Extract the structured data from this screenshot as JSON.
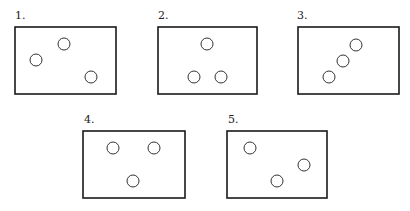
{
  "panels": [
    {
      "label": "1.",
      "rect": {
        "x": 15,
        "y": 27,
        "w": 101,
        "h": 67
      },
      "label_pos": {
        "x": 15,
        "y": 19
      },
      "circles": [
        {
          "cx": 36,
          "cy": 60
        },
        {
          "cx": 64,
          "cy": 44
        },
        {
          "cx": 91,
          "cy": 77
        }
      ]
    },
    {
      "label": "2.",
      "rect": {
        "x": 158,
        "y": 27,
        "w": 99,
        "h": 67
      },
      "label_pos": {
        "x": 158,
        "y": 19
      },
      "circles": [
        {
          "cx": 207,
          "cy": 44
        },
        {
          "cx": 194,
          "cy": 77
        },
        {
          "cx": 221,
          "cy": 77
        }
      ]
    },
    {
      "label": "3.",
      "rect": {
        "x": 298,
        "y": 27,
        "w": 101,
        "h": 67
      },
      "label_pos": {
        "x": 297,
        "y": 19
      },
      "circles": [
        {
          "cx": 356,
          "cy": 45
        },
        {
          "cx": 343,
          "cy": 61
        },
        {
          "cx": 329,
          "cy": 77
        }
      ]
    },
    {
      "label": "4.",
      "rect": {
        "x": 83,
        "y": 131,
        "w": 102,
        "h": 67
      },
      "label_pos": {
        "x": 84,
        "y": 123
      },
      "circles": [
        {
          "cx": 113,
          "cy": 148
        },
        {
          "cx": 154,
          "cy": 148
        },
        {
          "cx": 133,
          "cy": 181
        }
      ]
    },
    {
      "label": "5.",
      "rect": {
        "x": 227,
        "y": 131,
        "w": 100,
        "h": 67
      },
      "label_pos": {
        "x": 228,
        "y": 123
      },
      "circles": [
        {
          "cx": 250,
          "cy": 148
        },
        {
          "cx": 304,
          "cy": 165
        },
        {
          "cx": 277,
          "cy": 181
        }
      ]
    }
  ],
  "circle_radius": 6,
  "colors": {
    "stroke": "#1a1a1a",
    "background": "#ffffff"
  }
}
